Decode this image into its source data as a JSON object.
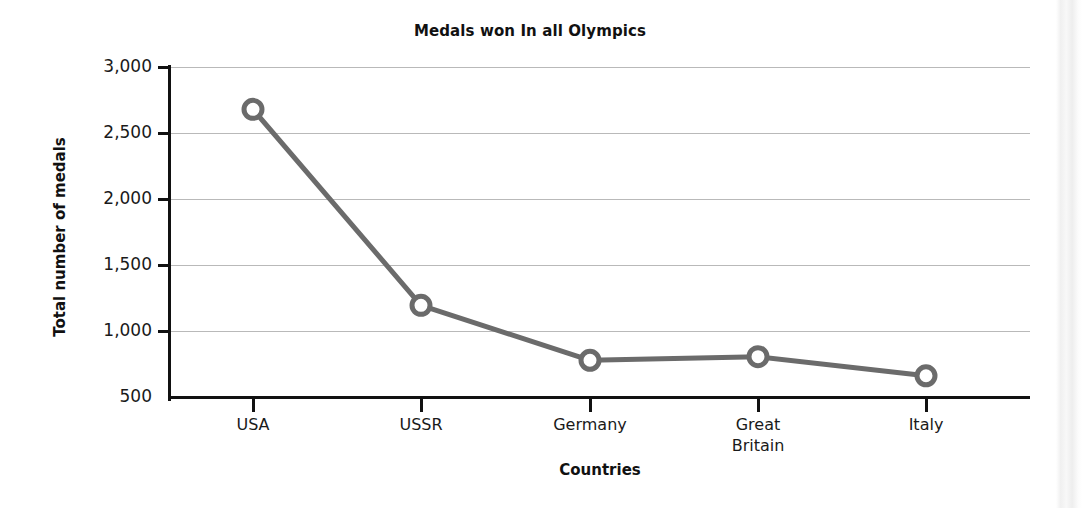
{
  "chart_data": {
    "type": "line",
    "title": "Medals won In all Olympics",
    "xlabel": "Countries",
    "ylabel": "Total number of medals",
    "categories": [
      "USA",
      "USSR",
      "Germany",
      "Great Britain",
      "Italy"
    ],
    "values": [
      2680,
      1200,
      785,
      812,
      668
    ],
    "series": [
      {
        "name": "Total number of medals",
        "values": [
          2680,
          1200,
          785,
          812,
          668
        ]
      }
    ],
    "ylim": [
      500,
      3000
    ],
    "y_ticks": [
      500,
      1000,
      1500,
      2000,
      2500,
      3000
    ],
    "y_tick_labels": [
      "500",
      "1,000",
      "1,500",
      "2,000",
      "2,500",
      "3,000"
    ],
    "grid": "horizontal",
    "legend": "none",
    "marker": "open-circle",
    "line_color": "#6b6b6b",
    "marker_color": "#6b6b6b",
    "grid_color": "#b9b9b9",
    "axis_color": "#111111"
  },
  "x_tick_labels": [
    {
      "line1": "USA",
      "line2": ""
    },
    {
      "line1": "USSR",
      "line2": ""
    },
    {
      "line1": "Germany",
      "line2": ""
    },
    {
      "line1": "Great",
      "line2": "Britain"
    },
    {
      "line1": "Italy",
      "line2": ""
    }
  ]
}
